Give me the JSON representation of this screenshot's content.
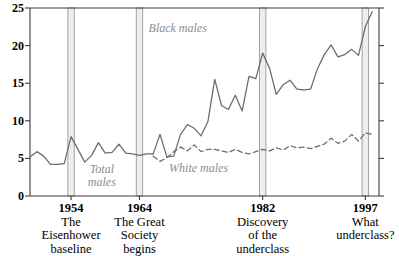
{
  "chart_data": {
    "type": "line",
    "title": "",
    "subtitle": "",
    "xlabel": "",
    "ylabel": "",
    "xlim": [
      1948,
      1999
    ],
    "ylim": [
      0,
      25
    ],
    "grid": false,
    "legend_position": "inline-annotations",
    "yticks": [
      0,
      5,
      10,
      15,
      20,
      25
    ],
    "ytick_labels": [
      "0",
      "5",
      "10",
      "15",
      "20",
      "25"
    ],
    "xticks": [
      1954,
      1964,
      1982,
      1997
    ],
    "xtick_labels": [
      "1954",
      "1964",
      "1982",
      "1997"
    ],
    "annotations": [
      {
        "name": "black-males-label",
        "text": "Black males",
        "x": 1970,
        "y": 22.2
      },
      {
        "name": "total-males-label",
        "text": "Total males",
        "x": 1958.5,
        "y": 3.6
      },
      {
        "name": "white-males-label",
        "text": "White males",
        "x": 1973,
        "y": 3.6
      }
    ],
    "event_markers": [
      {
        "year": 1954,
        "label": "1954",
        "caption": [
          "The",
          "Eisenhower",
          "baseline"
        ]
      },
      {
        "year": 1964,
        "label": "1964",
        "caption": [
          "The Great",
          "Society",
          "begins"
        ]
      },
      {
        "year": 1982,
        "label": "1982",
        "caption": [
          "Discovery",
          "of the",
          "underclass"
        ]
      },
      {
        "year": 1997,
        "label": "1997",
        "caption": [
          "What",
          "underclass?"
        ]
      }
    ],
    "series": [
      {
        "name": "Total males",
        "style": "solid",
        "color": "#6a6a6a",
        "x": [
          1948,
          1949,
          1950,
          1951,
          1952,
          1953,
          1954,
          1955,
          1956,
          1957,
          1958,
          1959,
          1960,
          1961,
          1962,
          1963,
          1964,
          1965,
          1966
        ],
        "values": [
          5.2,
          5.9,
          5.3,
          4.2,
          4.2,
          4.3,
          7.9,
          6.2,
          4.5,
          5.4,
          7.1,
          5.7,
          5.8,
          6.9,
          5.7,
          5.6,
          5.4,
          5.6,
          5.6
        ]
      },
      {
        "name": "Black males",
        "style": "solid",
        "color": "#6a6a6a",
        "x": [
          1966,
          1967,
          1968,
          1969,
          1970,
          1971,
          1972,
          1973,
          1974,
          1975,
          1976,
          1977,
          1978,
          1979,
          1980,
          1981,
          1982,
          1983,
          1984,
          1985,
          1986,
          1987,
          1988,
          1989,
          1990,
          1991,
          1992,
          1993,
          1994,
          1995,
          1996,
          1997,
          1998
        ],
        "values": [
          5.6,
          8.2,
          5.2,
          5.3,
          8.2,
          9.5,
          9.0,
          8.0,
          9.9,
          15.5,
          12.0,
          11.5,
          13.4,
          11.3,
          15.9,
          15.6,
          19.0,
          17.0,
          13.5,
          14.8,
          15.4,
          14.2,
          14.1,
          14.2,
          16.9,
          18.8,
          20.1,
          18.5,
          18.8,
          19.5,
          18.7,
          22.5,
          24.5
        ]
      },
      {
        "name": "White males",
        "style": "dashed",
        "color": "#6a6a6a",
        "x": [
          1966,
          1967,
          1968,
          1969,
          1970,
          1971,
          1972,
          1973,
          1974,
          1975,
          1976,
          1977,
          1978,
          1979,
          1980,
          1981,
          1982,
          1983,
          1984,
          1985,
          1986,
          1987,
          1988,
          1989,
          1990,
          1991,
          1992,
          1993,
          1994,
          1995,
          1996,
          1997,
          1998
        ],
        "values": [
          5.3,
          4.6,
          5.1,
          5.9,
          6.5,
          6.0,
          6.8,
          5.9,
          6.2,
          6.2,
          6.0,
          5.8,
          6.2,
          5.8,
          5.6,
          5.9,
          6.2,
          6.0,
          6.4,
          6.1,
          6.7,
          6.4,
          6.5,
          6.3,
          6.6,
          6.9,
          7.7,
          7.0,
          7.3,
          8.2,
          7.3,
          8.4,
          8.2
        ]
      }
    ],
    "colors": {
      "axis": "#3c3c3c",
      "line": "#6a6a6a",
      "band_fill": "#f0eeea",
      "band_edge": "#9a9a9a",
      "annotation_text": "#8c8c8c",
      "tick_text": "#000000"
    }
  }
}
